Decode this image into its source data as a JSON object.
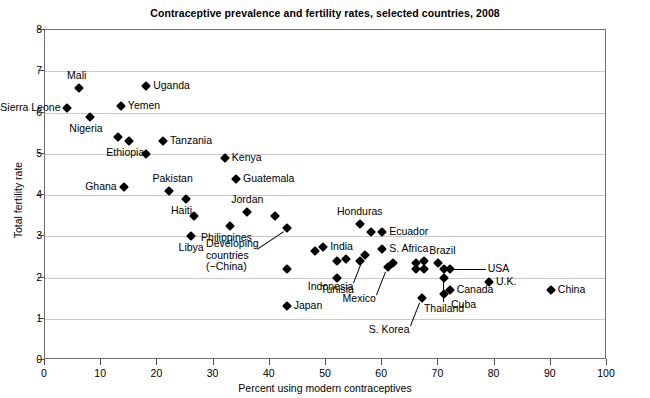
{
  "chart_data": {
    "type": "scatter",
    "title": "Contraceptive prevalence and fertility rates, selected countries, 2008",
    "xlabel": "Percent using modern contraceptives",
    "ylabel": "Total fertility rate",
    "xlim": [
      0,
      100
    ],
    "ylim": [
      0,
      8
    ],
    "xticks": [
      0,
      10,
      20,
      30,
      40,
      50,
      60,
      70,
      80,
      90,
      100
    ],
    "yticks": [
      0,
      1,
      2,
      3,
      4,
      5,
      6,
      7,
      8
    ],
    "grid": "horizontal",
    "legend": "none",
    "marker": "diamond",
    "marker_color": "#000000",
    "points": [
      {
        "name": "Sierra Leone",
        "x": 4,
        "y": 6.1,
        "label": "Sierra Leone",
        "pos": "left"
      },
      {
        "name": "Mali",
        "x": 6,
        "y": 6.6,
        "label": "Mali",
        "pos": "above-left"
      },
      {
        "name": "Nigeria",
        "x": 8,
        "y": 5.9,
        "label": "Nigeria",
        "pos": "below-left"
      },
      {
        "name": "Ethiopia-a",
        "x": 13,
        "y": 5.4,
        "label": "",
        "pos": "none"
      },
      {
        "name": "Ethiopia",
        "x": 15,
        "y": 5.3,
        "label": "Ethiopia",
        "pos": "below-left"
      },
      {
        "name": "Yemen",
        "x": 13.5,
        "y": 6.15,
        "label": "Yemen",
        "pos": "right"
      },
      {
        "name": "Uganda",
        "x": 18,
        "y": 6.65,
        "label": "Uganda",
        "pos": "right"
      },
      {
        "name": "Ghana",
        "x": 14,
        "y": 4.2,
        "label": "Ghana",
        "pos": "left"
      },
      {
        "name": "unlabeled-18",
        "x": 18,
        "y": 5.0,
        "label": "",
        "pos": "none"
      },
      {
        "name": "Tanzania",
        "x": 21,
        "y": 5.3,
        "label": "Tanzania",
        "pos": "right"
      },
      {
        "name": "Pakistan",
        "x": 22,
        "y": 4.1,
        "label": "Pakistan",
        "pos": "above-right"
      },
      {
        "name": "Haiti",
        "x": 25,
        "y": 3.9,
        "label": "Haiti",
        "pos": "below-left"
      },
      {
        "name": "unlabeled-26",
        "x": 26.5,
        "y": 3.5,
        "label": "",
        "pos": "none"
      },
      {
        "name": "Libya",
        "x": 26,
        "y": 3.0,
        "label": "Libya",
        "pos": "below"
      },
      {
        "name": "Kenya",
        "x": 32,
        "y": 4.9,
        "label": "Kenya",
        "pos": "right"
      },
      {
        "name": "Guatemala",
        "x": 34,
        "y": 4.4,
        "label": "Guatemala",
        "pos": "right"
      },
      {
        "name": "Philippines",
        "x": 33,
        "y": 3.25,
        "label": "Philippines",
        "pos": "below-left"
      },
      {
        "name": "Jordan",
        "x": 36,
        "y": 3.6,
        "label": "Jordan",
        "pos": "above"
      },
      {
        "name": "unlabeled-41",
        "x": 41,
        "y": 3.5,
        "label": "",
        "pos": "none"
      },
      {
        "name": "Developing countries (−China)",
        "x": 43,
        "y": 3.2,
        "label": "Developing\ncountries\n(−China)",
        "pos": "leader-left"
      },
      {
        "name": "unlabeled-43",
        "x": 43,
        "y": 2.2,
        "label": "",
        "pos": "none"
      },
      {
        "name": "Japan",
        "x": 43,
        "y": 1.3,
        "label": "Japan",
        "pos": "right"
      },
      {
        "name": "India-a",
        "x": 48,
        "y": 2.65,
        "label": "",
        "pos": "none"
      },
      {
        "name": "India",
        "x": 49.5,
        "y": 2.75,
        "label": "India",
        "pos": "right"
      },
      {
        "name": "unlabeled-52",
        "x": 52,
        "y": 2.4,
        "label": "",
        "pos": "none"
      },
      {
        "name": "unlabeled-53",
        "x": 53.5,
        "y": 2.45,
        "label": "",
        "pos": "none"
      },
      {
        "name": "Tunisia",
        "x": 52,
        "y": 2.0,
        "label": "Tunisia",
        "pos": "below"
      },
      {
        "name": "Honduras",
        "x": 56,
        "y": 3.3,
        "label": "Honduras",
        "pos": "above"
      },
      {
        "name": "unlabeled-56",
        "x": 56,
        "y": 2.4,
        "label": "",
        "pos": "none"
      },
      {
        "name": "Indonesia",
        "x": 57,
        "y": 2.55,
        "label": "Indonesia",
        "pos": "leader-below-left"
      },
      {
        "name": "unlabeled-58",
        "x": 58,
        "y": 3.1,
        "label": "",
        "pos": "none"
      },
      {
        "name": "Ecuador",
        "x": 60,
        "y": 3.1,
        "label": "Ecuador",
        "pos": "right"
      },
      {
        "name": "S. Africa",
        "x": 60,
        "y": 2.7,
        "label": "S. Africa",
        "pos": "right"
      },
      {
        "name": "Mexico",
        "x": 61,
        "y": 2.25,
        "label": "Mexico",
        "pos": "leader-below-left"
      },
      {
        "name": "unlabeled-62",
        "x": 62,
        "y": 2.35,
        "label": "",
        "pos": "none"
      },
      {
        "name": "S. Korea",
        "x": 67,
        "y": 1.5,
        "label": "S. Korea",
        "pos": "leader-below-left"
      },
      {
        "name": "unlabeled-66",
        "x": 66,
        "y": 2.35,
        "label": "",
        "pos": "none"
      },
      {
        "name": "unlabeled-67",
        "x": 67.5,
        "y": 2.4,
        "label": "",
        "pos": "none"
      },
      {
        "name": "unlabeled-66b",
        "x": 66,
        "y": 2.2,
        "label": "",
        "pos": "none"
      },
      {
        "name": "unlabeled-67b",
        "x": 67.5,
        "y": 2.2,
        "label": "",
        "pos": "none"
      },
      {
        "name": "Brazil",
        "x": 70,
        "y": 2.35,
        "label": "Brazil",
        "pos": "above-right"
      },
      {
        "name": "USA",
        "x": 72,
        "y": 2.2,
        "label": "USA",
        "pos": "leader-right"
      },
      {
        "name": "unlabeled-71",
        "x": 71,
        "y": 2.0,
        "label": "",
        "pos": "none"
      },
      {
        "name": "Thailand",
        "x": 71,
        "y": 2.2,
        "label": "Thailand",
        "pos": "leader-below"
      },
      {
        "name": "Canada",
        "x": 72,
        "y": 1.7,
        "label": "Canada",
        "pos": "right"
      },
      {
        "name": "Cuba",
        "x": 71,
        "y": 1.6,
        "label": "Cuba",
        "pos": "below-right"
      },
      {
        "name": "U.K.",
        "x": 79,
        "y": 1.9,
        "label": "U.K.",
        "pos": "right"
      },
      {
        "name": "China",
        "x": 90,
        "y": 1.7,
        "label": "China",
        "pos": "right"
      }
    ]
  },
  "axes": {
    "title": "Contraceptive prevalence and fertility rates, selected countries, 2008",
    "x_title": "Percent using modern contraceptives",
    "y_title": "Total fertility rate"
  }
}
